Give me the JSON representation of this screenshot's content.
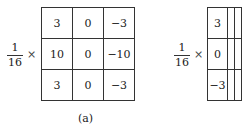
{
  "figures": [
    {
      "label": "(a)",
      "scale": {
        "numerator": "1",
        "denominator": "16",
        "operator": "×"
      },
      "matrix": [
        [
          "3",
          "0",
          "−3"
        ],
        [
          "10",
          "0",
          "−10"
        ],
        [
          "3",
          "0",
          "−3"
        ]
      ]
    },
    {
      "label": "(b)",
      "scale": {
        "numerator": "1",
        "denominator": "16",
        "operator": "×"
      },
      "matrix": [
        [
          "3",
          "",
          ""
        ],
        [
          "0",
          "",
          ""
        ],
        [
          "−3",
          "",
          ""
        ]
      ]
    }
  ]
}
